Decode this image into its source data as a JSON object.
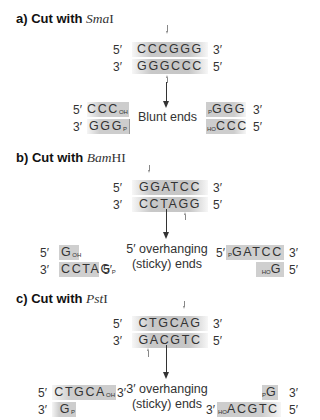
{
  "panels": [
    {
      "id": "a",
      "title_prefix": "a) Cut with ",
      "enzyme_italic": "Sma",
      "enzyme_roman": "I",
      "top_strand": {
        "left_end": "5′",
        "sequence": "CCCGGG",
        "right_end": "3′"
      },
      "bottom_strand": {
        "left_end": "3′",
        "sequence": "GGGCCC",
        "right_end": "5′"
      },
      "result_label": [
        "Blunt ends"
      ],
      "left_product": {
        "top": {
          "end": "5′",
          "seq": "CCC",
          "sub": "OH"
        },
        "bottom": {
          "end": "3′",
          "seq": "GGG",
          "sub": "P"
        }
      },
      "right_product": {
        "top": {
          "pre": "P",
          "seq": "GGG",
          "end": "3′"
        },
        "bottom": {
          "pre": "HO",
          "seq": "CCC",
          "end": "5′"
        }
      }
    },
    {
      "id": "b",
      "title_prefix": "b) Cut with ",
      "enzyme_italic": "Bam",
      "enzyme_roman": "HI",
      "top_strand": {
        "left_end": "5′",
        "sequence": "GGATCC",
        "right_end": "3′"
      },
      "bottom_strand": {
        "left_end": "3′",
        "sequence": "CCTAGG",
        "right_end": "5′"
      },
      "result_label": [
        "5′ overhanging",
        "(sticky) ends"
      ],
      "left_product": {
        "top": {
          "end": "5′",
          "seq": "G",
          "sub": "OH"
        },
        "bottom": {
          "end": "3′",
          "seq": "CCTAG",
          "sub": "P",
          "end_right": "5′"
        }
      },
      "right_product": {
        "top": {
          "end_left": "5′",
          "pre": "P",
          "seq": "GATCC",
          "end": "3′"
        },
        "bottom": {
          "pre": "HO",
          "seq": "G",
          "end": "5′"
        }
      }
    },
    {
      "id": "c",
      "title_prefix": "c) Cut with ",
      "enzyme_italic": "Pst",
      "enzyme_roman": "I",
      "top_strand": {
        "left_end": "5′",
        "sequence": "CTGCAG",
        "right_end": "3′"
      },
      "bottom_strand": {
        "left_end": "3′",
        "sequence": "GACGTC",
        "right_end": "5′"
      },
      "result_label": [
        "3′ overhanging",
        "(sticky) ends"
      ],
      "left_product": {
        "top": {
          "end": "5′",
          "seq": "CTGCA",
          "sub": "OH",
          "end_right": "3′"
        },
        "bottom": {
          "end": "3′",
          "seq": "G",
          "sub": "P"
        }
      },
      "right_product": {
        "top": {
          "pre": "P",
          "seq": "G",
          "end": "3′"
        },
        "bottom": {
          "end_left": "3′",
          "pre": "HO",
          "seq": "ACGTC",
          "end": "5′"
        }
      }
    }
  ],
  "colors": {
    "box_fill": "#c8c8c8",
    "text": "#333333",
    "arrow": "#333333"
  }
}
